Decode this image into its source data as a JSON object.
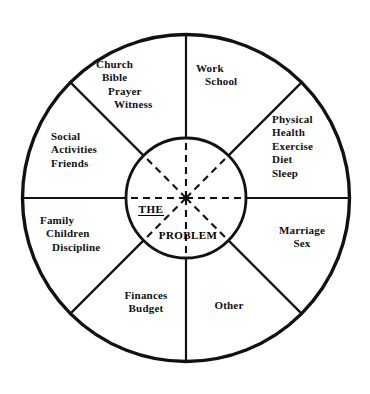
{
  "diagram": {
    "center": {
      "line1": "THE",
      "line2": "PROBLEM"
    },
    "geometry": {
      "outer_radius": 164,
      "inner_radius": 60,
      "center_x": 186,
      "center_y": 198,
      "sectors": 8,
      "spoke_style_outer": "solid",
      "spoke_style_inner": "dashed"
    },
    "colors": {
      "stroke": "#111111",
      "background": "#ffffff",
      "text": "#111111"
    },
    "sectors": [
      {
        "name": "church",
        "position": "top-left-upper",
        "align": "stagger",
        "lines": [
          "Church",
          "Bible",
          "Prayer",
          "Witness"
        ]
      },
      {
        "name": "work",
        "position": "top-right-upper",
        "align": "stagger",
        "lines": [
          "Work",
          "School"
        ]
      },
      {
        "name": "physical",
        "position": "right-upper",
        "align": "left",
        "lines": [
          "Physical",
          "Health",
          "Exercise",
          "Diet",
          "Sleep"
        ]
      },
      {
        "name": "marriage",
        "position": "right-lower",
        "align": "center",
        "lines": [
          "Marriage",
          "Sex"
        ]
      },
      {
        "name": "other",
        "position": "bottom-right",
        "align": "center",
        "lines": [
          "Other"
        ]
      },
      {
        "name": "finances",
        "position": "bottom-left",
        "align": "center",
        "lines": [
          "Finances",
          "Budget"
        ]
      },
      {
        "name": "family",
        "position": "left-lower",
        "align": "stagger",
        "lines": [
          "Family",
          "Children",
          "Discipline"
        ]
      },
      {
        "name": "social",
        "position": "left-upper",
        "align": "left",
        "lines": [
          "Social",
          "Activities",
          "Friends"
        ]
      }
    ]
  }
}
